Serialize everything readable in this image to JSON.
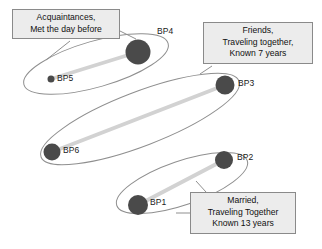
{
  "diagram": {
    "background_color": "#ffffff",
    "node_color": "#4a4a4a",
    "ellipse_stroke_color": "#8f8f8f",
    "link_color": "#d2d2d2",
    "callout_fill": "#ececec",
    "callout_border": "#8a8a8a",
    "nodes": [
      {
        "id": "BP4",
        "label": "BP4",
        "cx": 138,
        "cy": 52,
        "r": 12.5,
        "label_x": 157,
        "label_y": 32
      },
      {
        "id": "BP5",
        "label": "BP5",
        "cx": 51,
        "cy": 79,
        "r": 3.5,
        "label_x": 57,
        "label_y": 74
      },
      {
        "id": "BP3",
        "label": "BP3",
        "cx": 225,
        "cy": 85,
        "r": 9.5,
        "label_x": 238,
        "label_y": 79
      },
      {
        "id": "BP6",
        "label": "BP6",
        "cx": 52,
        "cy": 152,
        "r": 8.5,
        "label_x": 63,
        "label_y": 146
      },
      {
        "id": "BP2",
        "label": "BP2",
        "cx": 224,
        "cy": 160,
        "r": 9.0,
        "label_x": 237,
        "label_y": 153
      },
      {
        "id": "BP1",
        "label": "BP1",
        "cx": 138,
        "cy": 205,
        "r": 10.0,
        "label_x": 150,
        "label_y": 198
      }
    ],
    "links": [
      {
        "id": "link-bp5-bp4",
        "from": "BP5",
        "to": "BP4"
      },
      {
        "id": "link-bp6-bp3",
        "from": "BP6",
        "to": "BP3"
      },
      {
        "id": "link-bp1-bp2",
        "from": "BP1",
        "to": "BP2"
      }
    ],
    "groups": [
      {
        "id": "group-acquaintances",
        "members": [
          "BP5",
          "BP4"
        ]
      },
      {
        "id": "group-friends",
        "members": [
          "BP6",
          "BP3"
        ]
      },
      {
        "id": "group-married",
        "members": [
          "BP1",
          "BP2"
        ]
      }
    ],
    "callouts": [
      {
        "id": "callout-acquaintances",
        "lines": [
          "Acquaintances,",
          "Met the day before"
        ],
        "x": 12,
        "y": 9,
        "width": 108,
        "height": 32
      },
      {
        "id": "callout-friends",
        "lines": [
          "Friends,",
          "Traveling together,",
          "Known 7 years"
        ],
        "x": 203,
        "y": 22,
        "width": 110,
        "height": 44
      },
      {
        "id": "callout-married",
        "lines": [
          "Married,",
          "Traveling Together",
          "Known 13 years"
        ],
        "x": 190,
        "y": 192,
        "width": 106,
        "height": 45
      }
    ]
  }
}
